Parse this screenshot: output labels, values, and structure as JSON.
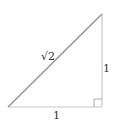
{
  "diagram": {
    "type": "right-triangle",
    "labels": {
      "hypotenuse": "√2",
      "base": "1",
      "height": "1"
    },
    "colors": {
      "hypotenuse": "#999999",
      "legs": "#c8c8c8",
      "label": "#333333"
    }
  }
}
